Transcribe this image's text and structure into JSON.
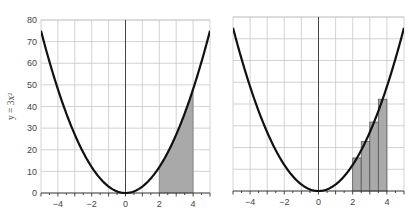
{
  "chart_data": [
    {
      "type": "line",
      "title": "",
      "function": "y = 3x^2",
      "xlabel": "",
      "ylabel": "y = 3x²",
      "xlim": [
        -5,
        5
      ],
      "ylim": [
        0,
        80
      ],
      "xticks": [
        -4,
        -2,
        0,
        2,
        4
      ],
      "xtick_labels": [
        "−4",
        "−2",
        "0",
        "2",
        "4"
      ],
      "yticks": [
        0,
        10,
        20,
        30,
        40,
        50,
        60,
        70,
        80
      ],
      "ytick_labels": [
        "0",
        "10",
        "20",
        "30",
        "40",
        "50",
        "60",
        "70",
        "80"
      ],
      "grid": true,
      "shaded_region": {
        "from_x": 2,
        "to_x": 4,
        "description": "area under curve"
      },
      "curve_points": {
        "x": [
          -5,
          -4,
          -3,
          -2,
          -1,
          0,
          1,
          2,
          3,
          4,
          5
        ],
        "y": [
          75,
          48,
          27,
          12,
          3,
          0,
          3,
          12,
          27,
          48,
          75
        ]
      }
    },
    {
      "type": "bar",
      "title": "",
      "function": "y = 3x^2",
      "xlabel": "",
      "ylabel": "",
      "xlim": [
        -5,
        5
      ],
      "ylim": [
        0,
        80
      ],
      "xticks": [
        -4,
        -2,
        0,
        2,
        4
      ],
      "xtick_labels": [
        "−4",
        "−2",
        "0",
        "2",
        "4"
      ],
      "grid": true,
      "rectangles": {
        "method": "midpoint Riemann sum",
        "width": 0.5,
        "x_left": [
          2.0,
          2.5,
          3.0,
          3.5
        ],
        "heights": [
          15.19,
          22.69,
          31.69,
          42.19
        ]
      },
      "curve_points": {
        "x": [
          -5,
          -4,
          -3,
          -2,
          -1,
          0,
          1,
          2,
          3,
          4,
          5
        ],
        "y": [
          75,
          48,
          27,
          12,
          3,
          0,
          3,
          12,
          27,
          48,
          75
        ]
      }
    }
  ],
  "colors": {
    "curve": "#111111",
    "grid": "#c8c8c8",
    "shade": "#a9a9a9"
  }
}
